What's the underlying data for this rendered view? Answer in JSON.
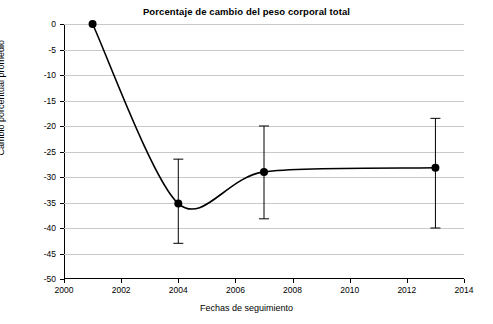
{
  "chart_data": {
    "type": "line",
    "title": "Porcentaje de cambio del peso corporal total",
    "xlabel": "Fechas de seguimiento",
    "ylabel": "Cambio porcentual promedio",
    "xlim": [
      2000,
      2014
    ],
    "ylim": [
      -50,
      0
    ],
    "grid": true,
    "legend": "none",
    "x_ticks": [
      "2000",
      "2002",
      "2004",
      "2006",
      "2008",
      "2010",
      "2012",
      "2014"
    ],
    "x_tick_values": [
      2000,
      2002,
      2004,
      2006,
      2008,
      2010,
      2012,
      2014
    ],
    "y_ticks": [
      "0",
      "-5",
      "-10",
      "-15",
      "-20",
      "-25",
      "-30",
      "-35",
      "-40",
      "-45",
      "-50"
    ],
    "y_tick_values": [
      0,
      -5,
      -10,
      -15,
      -20,
      -25,
      -30,
      -35,
      -40,
      -45,
      -50
    ],
    "series": [
      {
        "name": "Cambio porcentual promedio",
        "x": [
          2001,
          2004,
          2007,
          2013
        ],
        "values": [
          0,
          -35.2,
          -29.0,
          -28.2
        ],
        "error_low": [
          0,
          -43.0,
          -38.2,
          -40.0
        ],
        "error_high": [
          0,
          -26.5,
          -20.0,
          -18.5
        ]
      }
    ]
  },
  "marker": {
    "color": "#000000",
    "radius": 4
  },
  "line": {
    "color": "#000000",
    "width": 1.6
  }
}
